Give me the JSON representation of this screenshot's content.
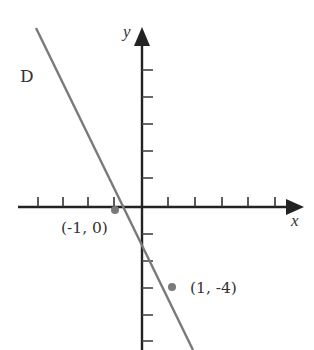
{
  "diagram": {
    "line_label": "D",
    "x_axis_label": "x",
    "y_axis_label": "y",
    "points": [
      {
        "label": "(-1, 0)",
        "x": -1,
        "y": 0
      },
      {
        "label": "(1, -4)",
        "x": 1,
        "y": -4
      }
    ],
    "line": {
      "name": "D",
      "slope": -2,
      "intercept": -2,
      "color": "#7a7a7a"
    },
    "axis_color": "#222222",
    "point_color": "#7a7a7a",
    "x_ticks": {
      "left": 4,
      "right": 5
    },
    "y_ticks": {
      "above": 5,
      "below": 5
    }
  }
}
